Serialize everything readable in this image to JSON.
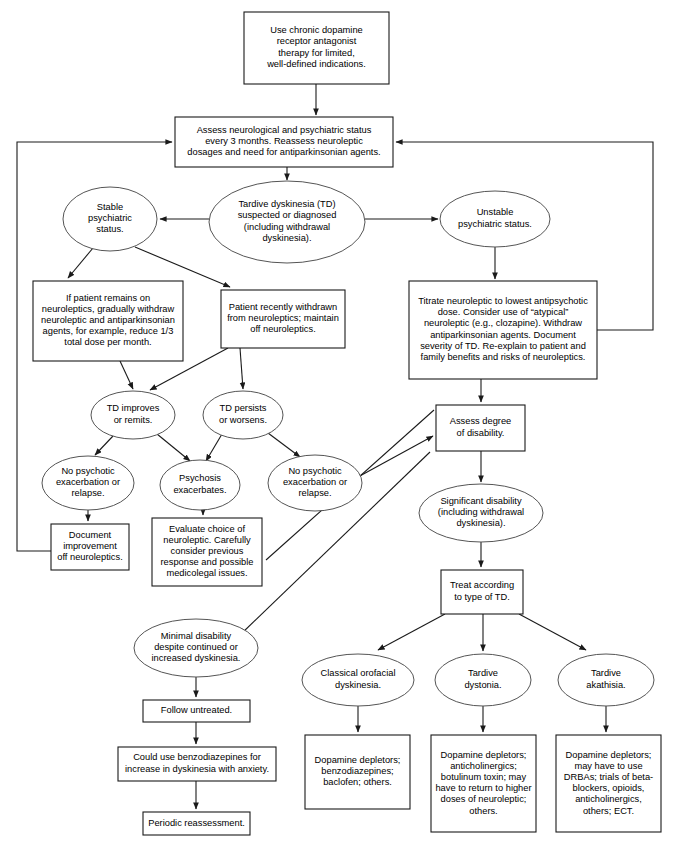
{
  "diagram": {
    "colors": {
      "background": "#ffffff",
      "box_stroke": "#1a1a1a",
      "ellipse_stroke": "#555555",
      "text": "#000000",
      "edge": "#1a1a1a"
    },
    "nodes": [
      {
        "id": "n1",
        "shape": "rect",
        "name": "chronic-therapy-box",
        "x": 244,
        "y": 12,
        "w": 145,
        "h": 72,
        "lines": [
          "Use chronic dopamine",
          "receptor antagonist",
          "therapy for limited,",
          "well-defined indications."
        ]
      },
      {
        "id": "n2",
        "shape": "rect",
        "name": "assess-status-box",
        "x": 175,
        "y": 117,
        "w": 218,
        "h": 50,
        "lines": [
          "Assess neurological and psychiatric status",
          "every 3 months. Reassess neuroleptic",
          "dosages and need for antiparkinsonian agents."
        ]
      },
      {
        "id": "n3",
        "shape": "ellipse",
        "name": "stable-psychiatric-status-ellipse",
        "cx": 110,
        "cy": 219,
        "rx": 47,
        "ry": 32,
        "lines": [
          "Stable",
          "psychiatric",
          "status."
        ]
      },
      {
        "id": "n4",
        "shape": "ellipse",
        "name": "td-suspected-ellipse",
        "cx": 287,
        "cy": 222,
        "rx": 78,
        "ry": 41,
        "lines": [
          "Tardive dyskinesia (TD)",
          "suspected or diagnosed",
          "(including withdrawal",
          "dyskinesia)."
        ]
      },
      {
        "id": "n5",
        "shape": "ellipse",
        "cx": 495,
        "cy": 219,
        "rx": 55,
        "ry": 28,
        "name": "unstable-psychiatric-status-ellipse",
        "lines": [
          "Unstable",
          "psychiatric status."
        ]
      },
      {
        "id": "n6",
        "shape": "rect",
        "name": "gradual-withdraw-box",
        "x": 33,
        "y": 281,
        "w": 150,
        "h": 80,
        "lines": [
          "If patient remains on",
          "neuroleptics, gradually withdraw",
          "neuroleptic and antiparkinsonian",
          "agents, for example, reduce 1/3",
          "total dose per month."
        ]
      },
      {
        "id": "n7",
        "shape": "rect",
        "name": "recently-withdrawn-box",
        "x": 221,
        "y": 290,
        "w": 124,
        "h": 58,
        "lines": [
          "Patient recently withdrawn",
          "from neuroleptics; maintain",
          "off neuroleptics."
        ]
      },
      {
        "id": "n8",
        "shape": "rect",
        "name": "titrate-neuroleptic-box",
        "x": 409,
        "y": 281,
        "w": 188,
        "h": 98,
        "lines": [
          "Titrate neuroleptic to lowest antipsychotic",
          "dose. Consider use of “atypical”",
          "neuroleptic (e.g., clozapine). Withdraw",
          "antiparkinsonian agents. Document",
          "severity of TD. Re-explain to patient and",
          "family benefits and risks of neuroleptics."
        ]
      },
      {
        "id": "n9",
        "shape": "ellipse",
        "name": "td-improves-ellipse",
        "cx": 133,
        "cy": 415,
        "rx": 42,
        "ry": 24,
        "lines": [
          "TD improves",
          "or remits."
        ]
      },
      {
        "id": "n10",
        "shape": "ellipse",
        "name": "td-persists-ellipse",
        "cx": 243,
        "cy": 415,
        "rx": 40,
        "ry": 24,
        "lines": [
          "TD  persists",
          "or worsens."
        ]
      },
      {
        "id": "n11",
        "shape": "ellipse",
        "name": "no-exacerbation-left-ellipse",
        "cx": 88,
        "cy": 483,
        "rx": 46,
        "ry": 27,
        "lines": [
          "No psychotic",
          "exacerbation or",
          "relapse."
        ]
      },
      {
        "id": "n12",
        "shape": "ellipse",
        "name": "psychosis-exacerbates-ellipse",
        "cx": 200,
        "cy": 485,
        "rx": 40,
        "ry": 25,
        "lines": [
          "Psychosis",
          "exacerbates."
        ]
      },
      {
        "id": "n13",
        "shape": "ellipse",
        "name": "no-exacerbation-right-ellipse",
        "cx": 315,
        "cy": 483,
        "rx": 47,
        "ry": 28,
        "lines": [
          "No psychotic",
          "exacerbation or",
          "relapse."
        ]
      },
      {
        "id": "n14",
        "shape": "rect",
        "name": "document-improvement-box",
        "x": 51,
        "y": 524,
        "w": 78,
        "h": 46,
        "lines": [
          "Document",
          "improvement",
          "off neuroleptics."
        ]
      },
      {
        "id": "n15",
        "shape": "rect",
        "name": "evaluate-choice-box",
        "x": 152,
        "y": 518,
        "w": 110,
        "h": 68,
        "lines": [
          "Evaluate choice of",
          "neuroleptic. Carefully",
          "consider previous",
          "response and possible",
          "medicolegal issues."
        ]
      },
      {
        "id": "n16",
        "shape": "rect",
        "name": "assess-degree-disability-box",
        "x": 436,
        "y": 405,
        "w": 89,
        "h": 46,
        "lines": [
          "Assess degree",
          "of disability."
        ]
      },
      {
        "id": "n17",
        "shape": "ellipse",
        "name": "significant-disability-ellipse",
        "cx": 481,
        "cy": 513,
        "rx": 62,
        "ry": 29,
        "lines": [
          "Significant disability",
          "(including withdrawal",
          "dyskinesia)."
        ]
      },
      {
        "id": "n18",
        "shape": "rect",
        "name": "treat-by-type-box",
        "x": 441,
        "y": 570,
        "w": 82,
        "h": 44,
        "lines": [
          "Treat according",
          "to type of TD."
        ]
      },
      {
        "id": "n19",
        "shape": "ellipse",
        "name": "minimal-disability-ellipse",
        "cx": 196,
        "cy": 648,
        "rx": 62,
        "ry": 29,
        "lines": [
          "Minimal disability",
          "despite continued or",
          "increased dyskinesia."
        ]
      },
      {
        "id": "n20",
        "shape": "rect",
        "name": "follow-untreated-box",
        "x": 143,
        "y": 700,
        "w": 107,
        "h": 22,
        "lines": [
          "Follow untreated."
        ]
      },
      {
        "id": "n21",
        "shape": "rect",
        "name": "benzodiazepines-box",
        "x": 118,
        "y": 747,
        "w": 158,
        "h": 34,
        "lines": [
          "Could use benzodiazepines for",
          "increase in dyskinesia with anxiety."
        ]
      },
      {
        "id": "n22",
        "shape": "rect",
        "name": "periodic-reassessment-box",
        "x": 143,
        "y": 812,
        "w": 107,
        "h": 23,
        "lines": [
          "Periodic reassessment."
        ]
      },
      {
        "id": "n23",
        "shape": "ellipse",
        "name": "classical-orofacial-ellipse",
        "cx": 358,
        "cy": 680,
        "rx": 56,
        "ry": 26,
        "lines": [
          "Classical orofacial",
          "dyskinesia."
        ]
      },
      {
        "id": "n24",
        "shape": "ellipse",
        "name": "tardive-dystonia-ellipse",
        "cx": 483,
        "cy": 680,
        "rx": 48,
        "ry": 26,
        "lines": [
          "Tardive",
          "dystonia."
        ]
      },
      {
        "id": "n25",
        "shape": "ellipse",
        "name": "tardive-akathisia-ellipse",
        "cx": 606,
        "cy": 680,
        "rx": 48,
        "ry": 26,
        "lines": [
          "Tardive",
          "akathisia."
        ]
      },
      {
        "id": "n26",
        "shape": "rect",
        "name": "orofacial-treatment-box",
        "x": 305,
        "y": 735,
        "w": 105,
        "h": 74,
        "lines": [
          "Dopamine depletors;",
          "benzodiazepines;",
          "baclofen; others."
        ]
      },
      {
        "id": "n27",
        "shape": "rect",
        "name": "dystonia-treatment-box",
        "x": 431,
        "y": 735,
        "w": 105,
        "h": 97,
        "lines": [
          "Dopamine depletors;",
          "anticholinergics;",
          "botulinum toxin; may",
          "have to return to higher",
          "doses of neuroleptic;",
          "others."
        ]
      },
      {
        "id": "n28",
        "shape": "rect",
        "name": "akathisia-treatment-box",
        "x": 556,
        "y": 735,
        "w": 105,
        "h": 97,
        "lines": [
          "Dopamine depletors;",
          "may have to use",
          "DRBAs; trials of beta-",
          "blockers, opioids,",
          "anticholinergics,",
          "others; ECT."
        ]
      }
    ],
    "edges": [
      {
        "name": "edge-chronic-to-assess",
        "d": "M 316,84 L 316,115",
        "arrow": true
      },
      {
        "name": "edge-assess-to-td",
        "d": "M 287,167 L 287,180",
        "arrow": true
      },
      {
        "name": "edge-td-to-stable",
        "d": "M 209,219 L 160,219",
        "arrow": true
      },
      {
        "name": "edge-td-to-unstable",
        "d": "M 365,219 L 438,219",
        "arrow": true
      },
      {
        "name": "edge-stable-to-gradual",
        "d": "M 93,248 L 68,278",
        "arrow": true
      },
      {
        "name": "edge-stable-to-recently",
        "d": "M 135,247 L 230,287",
        "arrow": true
      },
      {
        "name": "edge-unstable-to-titrate",
        "d": "M 495,247 L 495,279",
        "arrow": true
      },
      {
        "name": "edge-gradual-to-improves",
        "d": "M 120,361 L 133,389",
        "arrow": true
      },
      {
        "name": "edge-recently-to-persists",
        "d": "M 240,348 L 243,389",
        "arrow": true
      },
      {
        "name": "edge-recently-to-improves",
        "d": "M 228,348 L 150,390",
        "arrow": true
      },
      {
        "name": "edge-improves-to-nopsych",
        "d": "M 113,436 L 95,455",
        "arrow": true
      },
      {
        "name": "edge-improves-to-psychosis",
        "d": "M 157,434 L 190,461",
        "arrow": true
      },
      {
        "name": "edge-persists-to-psychosis",
        "d": "M 222,434 L 206,461",
        "arrow": true
      },
      {
        "name": "edge-persists-to-nopsych-right",
        "d": "M 268,433 L 300,457",
        "arrow": true
      },
      {
        "name": "edge-nopsych-to-document",
        "d": "M 88,510 L 88,521",
        "arrow": true
      },
      {
        "name": "edge-psychosis-to-evaluate",
        "d": "M 203,510 L 203,515",
        "arrow": true
      },
      {
        "name": "edge-nopsych-right-to-assess-degree",
        "d": "M 358,477 L 433,436",
        "arrow": true
      },
      {
        "name": "edge-titrate-to-assess-degree",
        "d": "M 481,379 L 481,402",
        "arrow": true
      },
      {
        "name": "edge-assess-degree-to-significant",
        "d": "M 481,451 L 481,482",
        "arrow": true
      },
      {
        "name": "edge-significant-to-treat",
        "d": "M 481,542 L 481,567",
        "arrow": true
      },
      {
        "name": "edge-assessdeg-to-minimal",
        "d": "M 430,452 L 240,635",
        "arrow": true
      },
      {
        "name": "edge-evaluate-to-assessdeg",
        "d": "M 266,560 L 434,410",
        "arrow": false
      },
      {
        "name": "edge-minimal-to-follow",
        "d": "M 196,677 L 196,697",
        "arrow": true
      },
      {
        "name": "edge-follow-to-benzo",
        "d": "M 196,722 L 196,744",
        "arrow": true
      },
      {
        "name": "edge-benzo-to-periodic",
        "d": "M 196,781 L 196,809",
        "arrow": true
      },
      {
        "name": "edge-treat-to-orofacial",
        "d": "M 445,614 L 378,650",
        "arrow": true
      },
      {
        "name": "edge-treat-to-dystonia",
        "d": "M 483,614 L 483,651",
        "arrow": true
      },
      {
        "name": "edge-treat-to-akathisia",
        "d": "M 519,614 L 586,650",
        "arrow": true
      },
      {
        "name": "edge-orofacial-to-treatment",
        "d": "M 358,706 L 358,732",
        "arrow": true
      },
      {
        "name": "edge-dystonia-to-treatment",
        "d": "M 483,706 L 483,732",
        "arrow": true
      },
      {
        "name": "edge-akathisia-to-treatment",
        "d": "M 606,706 L 606,732",
        "arrow": true
      },
      {
        "name": "edge-document-return-left",
        "d": "M 51,551 L 17,551 L 17,142 L 172,142",
        "arrow": true
      },
      {
        "name": "edge-titrate-return-right",
        "d": "M 597,330 L 653,330 L 653,142 L 396,142",
        "arrow": true
      }
    ]
  }
}
